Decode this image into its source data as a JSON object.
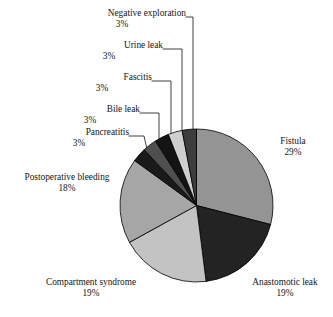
{
  "chart_data": {
    "type": "pie",
    "title": "",
    "subtitle": "",
    "xlabel": "",
    "ylabel": "",
    "legend_position": "none",
    "grid": false,
    "units": "percent",
    "total": 100,
    "categories": [
      "Fistula",
      "Anastomotic leak",
      "Compartment syndrome",
      "Postoperative bleeding",
      "Pancreatitis",
      "Bile leak",
      "Fascitis",
      "Urine leak",
      "Negative exploration"
    ],
    "values": [
      29,
      19,
      19,
      18,
      3,
      3,
      3,
      3,
      3
    ],
    "value_labels": [
      "29%",
      "19%",
      "19%",
      "18%",
      "3%",
      "3%",
      "3%",
      "3%",
      "3%"
    ],
    "colors": [
      "#949494",
      "#232323",
      "#c3c3c3",
      "#a6a6a6",
      "#1a1a1a",
      "#4f4f4f",
      "#141414",
      "#cfcfcf",
      "#3d3d3d"
    ],
    "slice_order": "clockwise-from-12",
    "slice_border_color": "#000000",
    "slices": [
      {
        "label": "Fistula",
        "value": 29,
        "value_label": "29%",
        "color": "#949494"
      },
      {
        "label": "Anastomotic leak",
        "value": 19,
        "value_label": "19%",
        "color": "#232323"
      },
      {
        "label": "Compartment syndrome",
        "value": 19,
        "value_label": "19%",
        "color": "#c3c3c3"
      },
      {
        "label": "Postoperative bleeding",
        "value": 18,
        "value_label": "18%",
        "color": "#a6a6a6"
      },
      {
        "label": "Pancreatitis",
        "value": 3,
        "value_label": "3%",
        "color": "#1a1a1a"
      },
      {
        "label": "Bile leak",
        "value": 3,
        "value_label": "3%",
        "color": "#4f4f4f"
      },
      {
        "label": "Fascitis",
        "value": 3,
        "value_label": "3%",
        "color": "#141414"
      },
      {
        "label": "Urine leak",
        "value": 3,
        "value_label": "3%",
        "color": "#cfcfcf"
      },
      {
        "label": "Negative exploration",
        "value": 3,
        "value_label": "3%",
        "color": "#3d3d3d"
      }
    ]
  },
  "labels": {
    "negative_exploration": {
      "name": "Negative exploration",
      "percent": "3%"
    },
    "urine_leak": {
      "name": "Urine leak",
      "percent": "3%"
    },
    "fascitis": {
      "name": "Fascitis",
      "percent": "3%"
    },
    "bile_leak": {
      "name": "Bile leak",
      "percent": "3%"
    },
    "pancreatitis": {
      "name": "Pancreatitis",
      "percent": "3%"
    },
    "postoperative_bleeding": {
      "name": "Postoperative bleeding",
      "percent": "18%"
    },
    "compartment_syndrome": {
      "name": "Compartment syndrome",
      "percent": "19%"
    },
    "anastomotic_leak": {
      "name": "Anastomotic leak",
      "percent": "19%"
    },
    "fistula": {
      "name": "Fistula",
      "percent": "29%"
    }
  }
}
